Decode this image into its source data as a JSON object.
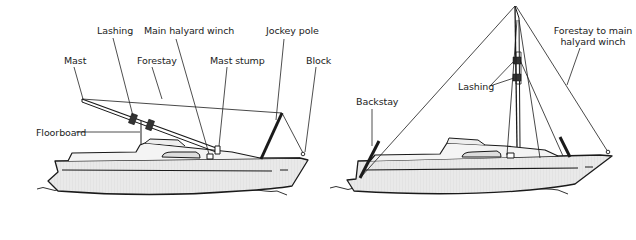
{
  "diagram": {
    "left": {
      "caption": "Lowered mast",
      "labels": {
        "mast": "Mast",
        "lashing": "Lashing",
        "forestay": "Forestay",
        "main_halyard_winch": "Main halyard winch",
        "mast_stump": "Mast stump",
        "jockey_pole": "Jockey pole",
        "block": "Block",
        "floorboard": "Floorboard"
      }
    },
    "right": {
      "caption": "Raised mast",
      "labels": {
        "backstay": "Backstay",
        "lashing": "Lashing",
        "forestay_line1": "Forestay to main",
        "forestay_line2": "halyard winch"
      }
    },
    "colors": {
      "line": "#1a1a1a",
      "hull_fill": "#e6e6e6",
      "deck_fill": "#f2f2f2",
      "label_text": "#222222"
    }
  }
}
